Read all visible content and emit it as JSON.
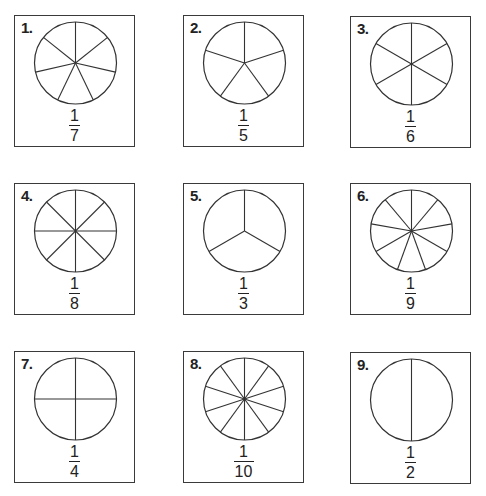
{
  "worksheet": {
    "items": [
      {
        "label": "1.",
        "parts": 7,
        "numerator": "1",
        "denominator": "7",
        "rotation": 0,
        "left": 14,
        "top": 15
      },
      {
        "label": "2.",
        "parts": 5,
        "numerator": "1",
        "denominator": "5",
        "rotation": 0,
        "left": 183,
        "top": 15
      },
      {
        "label": "3.",
        "parts": 6,
        "numerator": "1",
        "denominator": "6",
        "rotation": 0,
        "left": 350,
        "top": 16
      },
      {
        "label": "4.",
        "parts": 8,
        "numerator": "1",
        "denominator": "8",
        "rotation": 0,
        "left": 14,
        "top": 183
      },
      {
        "label": "5.",
        "parts": 3,
        "numerator": "1",
        "denominator": "3",
        "rotation": 0,
        "left": 183,
        "top": 183
      },
      {
        "label": "6.",
        "parts": 9,
        "numerator": "1",
        "denominator": "9",
        "rotation": 0,
        "left": 350,
        "top": 183
      },
      {
        "label": "7.",
        "parts": 4,
        "numerator": "1",
        "denominator": "4",
        "rotation": 0,
        "left": 14,
        "top": 351
      },
      {
        "label": "8.",
        "parts": 10,
        "numerator": "1",
        "denominator": "10",
        "rotation": 0,
        "left": 183,
        "top": 351
      },
      {
        "label": "9.",
        "parts": 2,
        "numerator": "1",
        "denominator": "2",
        "rotation": 0,
        "left": 350,
        "top": 352
      }
    ],
    "style": {
      "stroke_color": "#333333",
      "background": "#ffffff"
    }
  }
}
